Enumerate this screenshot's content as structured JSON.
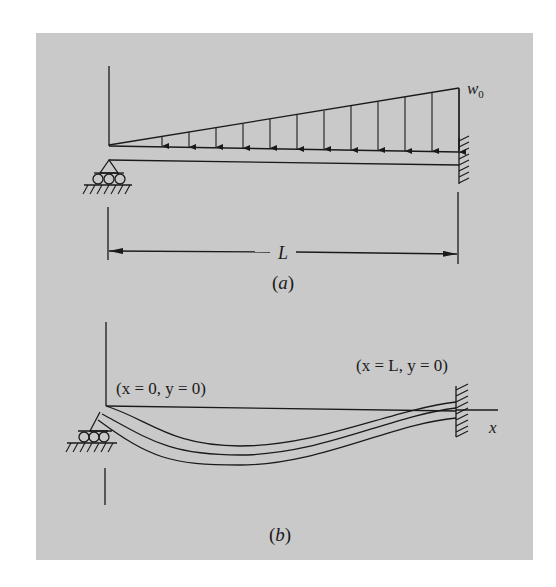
{
  "colors": {
    "page_background": "#ffffff",
    "panel_background": "#c9c9c9",
    "ink": "#1a1a1a"
  },
  "panel_a": {
    "caption": "(a)",
    "load_label": "w",
    "load_label_subscript": "0",
    "span_label": "L",
    "load_type": "linearly varying distributed load, zero at left support to w0 at fixed end",
    "left_support": "roller",
    "right_support": "fixed wall",
    "load_arrow_count": 13
  },
  "panel_b": {
    "caption": "(b)",
    "left_boundary_condition": "(x = 0, y = 0)",
    "right_boundary_condition": "(x = L, y = 0)",
    "axis_label": "x",
    "left_support": "roller",
    "right_support": "fixed wall"
  }
}
